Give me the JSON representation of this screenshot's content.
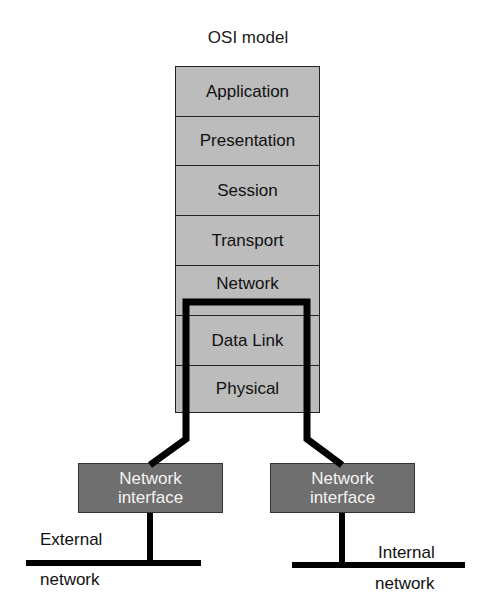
{
  "title": "OSI model",
  "layers": [
    {
      "name": "Application",
      "top": 0,
      "height": 50
    },
    {
      "name": "Presentation",
      "top": 50,
      "height": 49
    },
    {
      "name": "Session",
      "top": 99,
      "height": 50
    },
    {
      "name": "Transport",
      "top": 149,
      "height": 50
    },
    {
      "name": "Network",
      "top": 199,
      "height": 50
    },
    {
      "name": "Data Link",
      "top": 249,
      "height": 50
    },
    {
      "name": "Physical",
      "top": 299,
      "height": 48
    }
  ],
  "interfaces": {
    "left": {
      "line1": "Network",
      "line2": "interface"
    },
    "right": {
      "line1": "Network",
      "line2": "interface"
    }
  },
  "networks": {
    "external": {
      "line1": "External",
      "line2": "network"
    },
    "internal": {
      "line1": "Internal",
      "line2": "network"
    }
  },
  "colors": {
    "layer_fill": "#bcbcbc",
    "interface_fill": "#6f6f6f",
    "interface_text": "#f4f4f4",
    "line": "#000000"
  }
}
